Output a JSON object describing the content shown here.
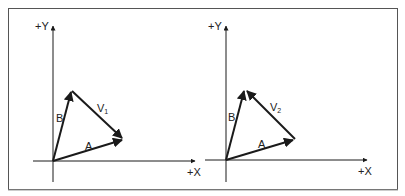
{
  "colors": {
    "stroke": "#1a1a1a",
    "frame": "#555555",
    "background": "#ffffff"
  },
  "panels": [
    {
      "id": "left",
      "axis_labels": {
        "y": "+Y",
        "x": "+X"
      },
      "vectors": {
        "a": {
          "label": "A"
        },
        "b": {
          "label": "B"
        },
        "v": {
          "label": "V",
          "subscript": "1"
        }
      }
    },
    {
      "id": "right",
      "axis_labels": {
        "y": "+Y",
        "x": "+X"
      },
      "vectors": {
        "a": {
          "label": "A"
        },
        "b": {
          "label": "B"
        },
        "v": {
          "label": "V",
          "subscript": "2"
        }
      }
    }
  ]
}
